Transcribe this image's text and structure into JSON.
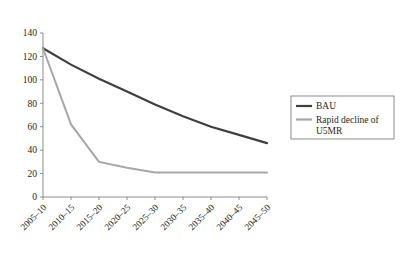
{
  "chart_data": {
    "type": "line",
    "title": "",
    "subtitle": "",
    "xlabel": "",
    "ylabel": "",
    "grid": false,
    "legend_position": "right",
    "categories": [
      "2005–10",
      "2010–15",
      "2015–20",
      "2020–25",
      "2025–30",
      "2030–35",
      "2035–40",
      "2040–45",
      "2045–50"
    ],
    "ylim": [
      0,
      140
    ],
    "yticks": [
      0,
      20,
      40,
      60,
      80,
      100,
      120,
      140
    ],
    "ytick_labels": [
      "0",
      "20",
      "40",
      "60",
      "80",
      "100",
      "120",
      "140"
    ],
    "series": [
      {
        "name": "BAU",
        "color": "#3f3f3f",
        "values": [
          127,
          113,
          101,
          90,
          79,
          69,
          60,
          53,
          46
        ]
      },
      {
        "name": "Rapid decline of U5MR",
        "color": "#a6a6a6",
        "values": [
          127,
          62,
          30,
          25,
          21,
          21,
          21,
          21,
          21
        ]
      }
    ]
  },
  "legend": {
    "items": [
      {
        "label": "BAU",
        "color": "#3f3f3f"
      },
      {
        "label": "Rapid decline of U5MR",
        "color": "#a6a6a6"
      }
    ]
  },
  "axis": {
    "line_color": "#8c8c8c",
    "tick_color": "#8c8c8c"
  }
}
